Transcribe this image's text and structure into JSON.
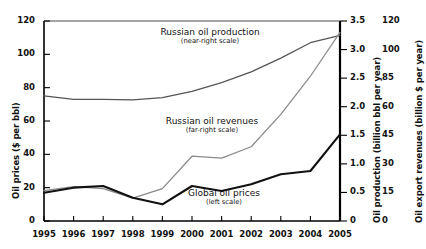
{
  "chart_data": {
    "type": "line",
    "title": "",
    "xlabel": "",
    "x": [
      1995,
      1996,
      1997,
      1998,
      1999,
      2000,
      2001,
      2002,
      2003,
      2004,
      2005
    ],
    "xticklabels": [
      "1995",
      "1996",
      "1997",
      "1998",
      "1999",
      "2000",
      "2001",
      "2002",
      "2003",
      "2004",
      "2005"
    ],
    "grid": false,
    "legend_position": "inline-annotations",
    "axes": [
      {
        "id": "left",
        "side": "left",
        "label": "Oil prices ($ per bbl)",
        "ticks": [
          0,
          20,
          40,
          60,
          80,
          100,
          120
        ],
        "ticklabels": [
          "0",
          "20",
          "40",
          "60",
          "80",
          "100",
          "120"
        ],
        "lim": [
          0,
          120
        ]
      },
      {
        "id": "near-right",
        "side": "right",
        "label": "Oil production (billion bbl per year)",
        "ticks": [
          0,
          0.5,
          1.0,
          1.5,
          2.0,
          2.5,
          3.0,
          3.5
        ],
        "ticklabels": [
          "0",
          "0.5",
          "1.0",
          "1.5",
          "2.0",
          "2.5",
          "3.0",
          "3.5"
        ],
        "lim": [
          0,
          3.5
        ]
      },
      {
        "id": "far-right",
        "side": "right",
        "label": "Oil export revenues (billion $ per year)",
        "ticks": [
          0,
          15,
          30,
          45,
          60,
          85,
          100,
          120
        ],
        "ticklabels": [
          "0",
          "15",
          "30",
          "45",
          "60",
          "85",
          "100",
          "120"
        ],
        "lim": [
          0,
          120
        ]
      }
    ],
    "series": [
      {
        "name": "Russian oil production",
        "sublabel": "(near-right scale)",
        "axis": "near-right",
        "unit": "billion bbl per year",
        "color": "#555555",
        "values": [
          2.19,
          2.13,
          2.13,
          2.12,
          2.16,
          2.27,
          2.42,
          2.61,
          2.85,
          3.12,
          3.25
        ]
      },
      {
        "name": "Russian oil revenues",
        "sublabel": "(far-right scale)",
        "axis": "far-right",
        "unit": "billion $ per year",
        "color": "#8a8a8a",
        "values": [
          16,
          18,
          17,
          12,
          17,
          34,
          33,
          39,
          56,
          86,
          112
        ]
      },
      {
        "name": "Global oil prices",
        "sublabel": "(left scale)",
        "axis": "left",
        "unit": "$ per bbl",
        "color": "#111111",
        "values": [
          17,
          20,
          21,
          14,
          10,
          21,
          18,
          22,
          28,
          30,
          52
        ]
      }
    ]
  }
}
